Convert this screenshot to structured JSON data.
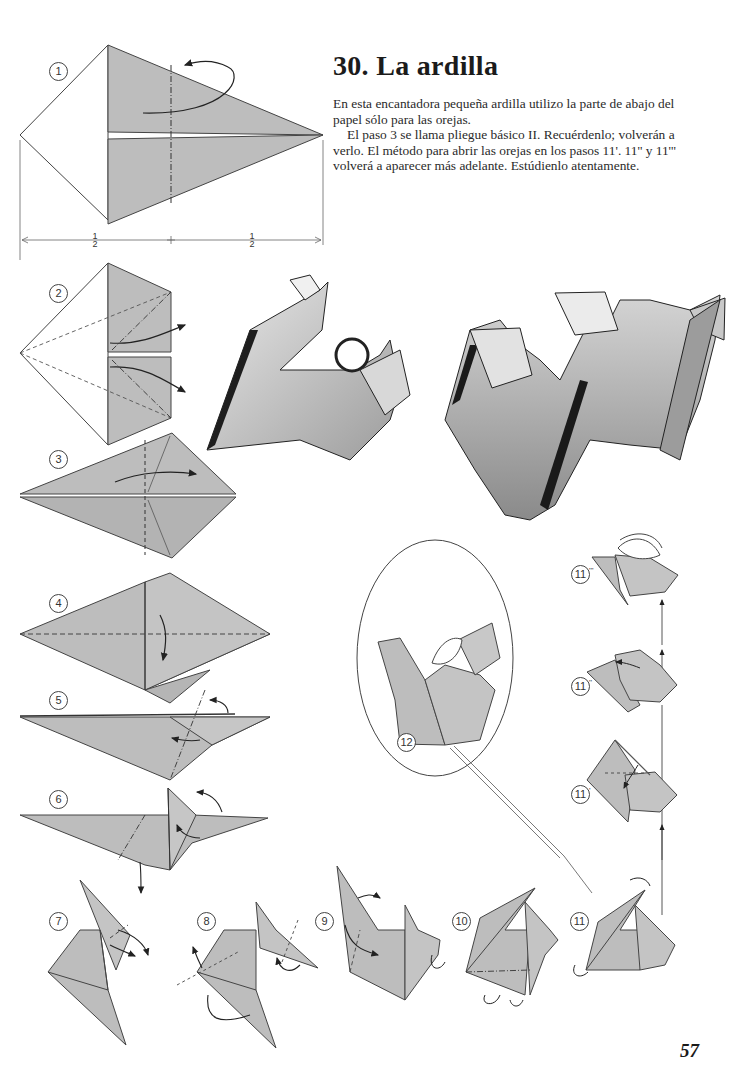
{
  "page": {
    "title": "30.  La ardilla",
    "intro_paragraphs": [
      "En esta encantadora pequeña ardilla utilizo la parte de abajo del papel sólo para las orejas.",
      "El paso 3 se llama pliegue básico II. Recuérdenlo; volverán a verlo. El método para abrir las orejas en los pasos 11'. 11'' y 11''' volverá a aparecer más adelante. Estúdienlo atentamente."
    ],
    "page_number": "57"
  },
  "diagram": {
    "measure_labels": {
      "left_num": "1",
      "left_den": "2",
      "right_num": "1",
      "right_den": "2"
    },
    "steps": [
      {
        "id": "1",
        "label": "1"
      },
      {
        "id": "2",
        "label": "2"
      },
      {
        "id": "3",
        "label": "3"
      },
      {
        "id": "4",
        "label": "4"
      },
      {
        "id": "5",
        "label": "5"
      },
      {
        "id": "6",
        "label": "6"
      },
      {
        "id": "7",
        "label": "7"
      },
      {
        "id": "8",
        "label": "8"
      },
      {
        "id": "9",
        "label": "9"
      },
      {
        "id": "10",
        "label": "10"
      },
      {
        "id": "11",
        "label": "11"
      },
      {
        "id": "11a",
        "label": "11",
        "prime": "'"
      },
      {
        "id": "11b",
        "label": "11",
        "prime": "''"
      },
      {
        "id": "11c",
        "label": "11",
        "prime": "'''"
      },
      {
        "id": "12",
        "label": "12"
      }
    ],
    "colors": {
      "paper": "#bdbdbd",
      "paper_dark": "#9a9a9a",
      "line": "#333333",
      "photo_shadow": "#202020"
    }
  }
}
